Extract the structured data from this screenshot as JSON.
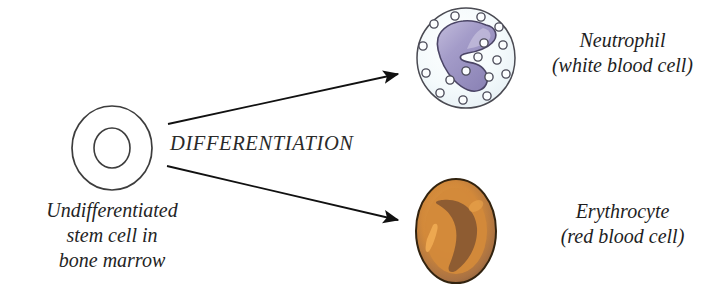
{
  "diagram": {
    "background_color": "#ffffff",
    "process_label": "DIFFERENTIATION"
  },
  "stem_cell": {
    "caption_lines": [
      "Undifferentiated",
      "stem cell in",
      "bone marrow"
    ],
    "membrane_color": "#ffffff",
    "outline_color": "#3d3d3d",
    "nucleus_color": "#ffffff",
    "nucleus_outline_color": "#3d3d3d",
    "center": {
      "x": 112,
      "y": 148
    },
    "radius_x": 40,
    "radius_y": 42,
    "nucleus_radius_x": 18,
    "nucleus_radius_y": 20
  },
  "neutrophil": {
    "name": "Neutrophil",
    "subtitle": "(white blood cell)",
    "cytoplasm_color": "#f4f9fb",
    "outline_color": "#4a4a52",
    "nucleus_color": "#9b93c4",
    "nucleus_highlight_color": "#b8b2d8",
    "nucleus_outline_color": "#4b4566",
    "granule_count": 17,
    "granule_outline_color": "#4a4a58",
    "center": {
      "x": 466,
      "y": 58
    },
    "radius_x": 49,
    "radius_y": 50
  },
  "erythrocyte": {
    "name": "Erythrocyte",
    "subtitle": "(red blood cell)",
    "body_color": "#d2893a",
    "rim_color": "#8d6038",
    "outline_color": "#3a2a1c",
    "dimple_color": "#8a5a32",
    "highlight_color": "#eda74f",
    "center": {
      "x": 456,
      "y": 231
    },
    "radius_x": 40,
    "radius_y": 52
  },
  "arrows": [
    {
      "name": "arrow-to-neutrophil",
      "from": {
        "x": 168,
        "y": 124
      },
      "to": {
        "x": 402,
        "y": 73
      },
      "color": "#111111"
    },
    {
      "name": "arrow-to-erythrocyte",
      "from": {
        "x": 167,
        "y": 166
      },
      "to": {
        "x": 402,
        "y": 221
      },
      "color": "#111111"
    }
  ]
}
